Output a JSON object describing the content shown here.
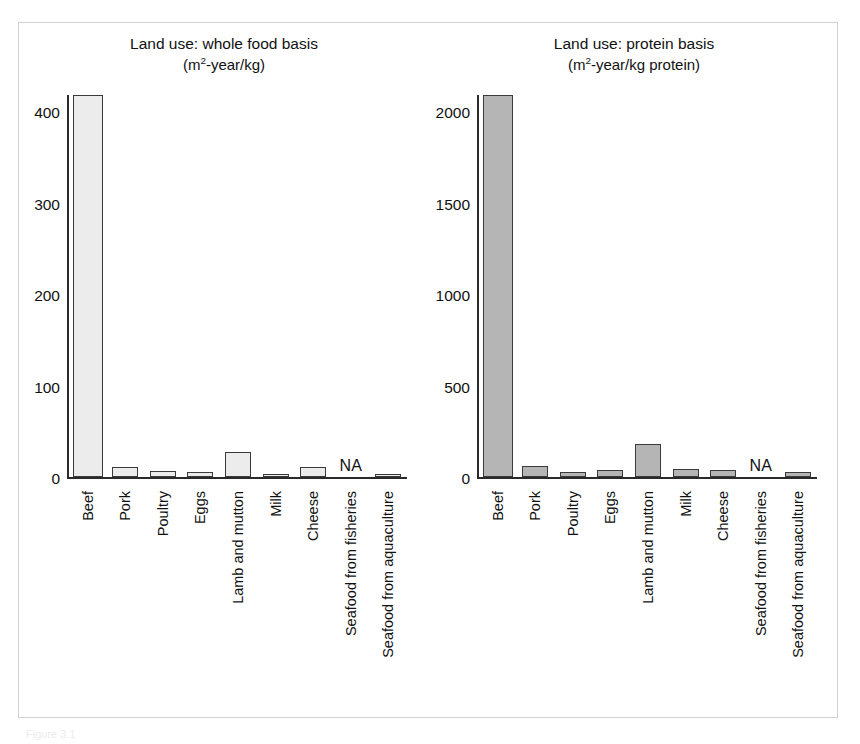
{
  "figure": {
    "caption_fragment": "Figure 3.1"
  },
  "chart_data": [
    {
      "type": "bar",
      "title": "Land use: whole food basis",
      "subtitle": "(m2-year/kg)",
      "subtitle_prefix": "(m",
      "subtitle_sup": "2",
      "subtitle_suffix": "-year/kg)",
      "xlabel": "",
      "ylabel": "",
      "ylim": [
        0,
        420
      ],
      "yticks": [
        0,
        100,
        200,
        300,
        400
      ],
      "ytick_labels": [
        "0",
        "100",
        "200",
        "300",
        "400"
      ],
      "grid": false,
      "legend": "none",
      "bar_fill": "#ececec",
      "bar_stroke": "#3a3a3a",
      "categories": [
        "Beef",
        "Pork",
        "Poultry",
        "Eggs",
        "Lamb and mutton",
        "Milk",
        "Cheese",
        "Seafood from fisheries",
        "Seafood from aquaculture"
      ],
      "values": [
        420,
        11,
        7,
        6,
        28,
        1.5,
        12,
        null,
        4
      ],
      "value_labels": [
        "420",
        "11",
        "7",
        "6",
        "28",
        "1.5",
        "12",
        "NA",
        "4"
      ],
      "missing_label": "NA"
    },
    {
      "type": "bar",
      "title": "Land use: protein basis",
      "subtitle": "(m2-year/kg protein)",
      "subtitle_prefix": "(m",
      "subtitle_sup": "2",
      "subtitle_suffix": "-year/kg protein)",
      "xlabel": "",
      "ylabel": "",
      "ylim": [
        0,
        2100
      ],
      "yticks": [
        0,
        500,
        1000,
        1500,
        2000
      ],
      "ytick_labels": [
        "0",
        "500",
        "1000",
        "1500",
        "2000"
      ],
      "grid": false,
      "legend": "none",
      "bar_fill": "#b5b5b5",
      "bar_stroke": "#3a3a3a",
      "categories": [
        "Beef",
        "Pork",
        "Poultry",
        "Eggs",
        "Lamb and mutton",
        "Milk",
        "Cheese",
        "Seafood from fisheries",
        "Seafood from aquaculture"
      ],
      "values": [
        2100,
        65,
        30,
        42,
        185,
        45,
        42,
        null,
        28
      ],
      "value_labels": [
        "2100",
        "65",
        "30",
        "42",
        "185",
        "45",
        "42",
        "NA",
        "28"
      ],
      "missing_label": "NA"
    }
  ]
}
